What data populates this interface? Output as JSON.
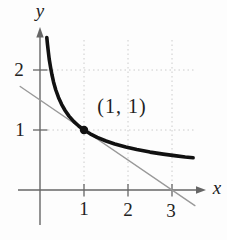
{
  "figure": {
    "background": "#fdfdfd"
  },
  "chart_data": {
    "type": "line",
    "title": "",
    "xlabel": "x",
    "ylabel": "y",
    "xlim": [
      -0.5,
      3.65
    ],
    "ylim": [
      -0.58,
      2.55
    ],
    "grid": {
      "style": "dotted",
      "vertical_x": [
        1,
        2,
        3
      ],
      "horizontal_y": [
        1,
        2
      ]
    },
    "x_ticks": [
      {
        "value": 1,
        "label": "1"
      },
      {
        "value": 2,
        "label": "2"
      },
      {
        "value": 3,
        "label": "3"
      }
    ],
    "y_ticks": [
      {
        "value": 1,
        "label": "1"
      },
      {
        "value": 2,
        "label": "2"
      }
    ],
    "series": [
      {
        "name": "tangent line y = (3 - x)/2",
        "color": "#999999",
        "width": 1.4,
        "points": [
          [
            -0.45,
            1.725
          ],
          [
            3.52,
            -0.26
          ]
        ]
      },
      {
        "name": "curve y = 1/sqrt(x)",
        "color": "#111111",
        "width": 3.6,
        "points": [
          [
            0.155,
            2.541
          ],
          [
            0.17,
            2.425
          ],
          [
            0.19,
            2.294
          ],
          [
            0.21,
            2.182
          ],
          [
            0.24,
            2.041
          ],
          [
            0.27,
            1.925
          ],
          [
            0.31,
            1.796
          ],
          [
            0.36,
            1.667
          ],
          [
            0.42,
            1.543
          ],
          [
            0.49,
            1.429
          ],
          [
            0.57,
            1.325
          ],
          [
            0.66,
            1.231
          ],
          [
            0.77,
            1.14
          ],
          [
            0.88,
            1.066
          ],
          [
            1.0,
            1.0
          ],
          [
            1.14,
            0.937
          ],
          [
            1.3,
            0.877
          ],
          [
            1.5,
            0.816
          ],
          [
            1.7,
            0.767
          ],
          [
            1.95,
            0.716
          ],
          [
            2.2,
            0.674
          ],
          [
            2.5,
            0.632
          ],
          [
            2.8,
            0.598
          ],
          [
            3.1,
            0.568
          ],
          [
            3.3,
            0.55
          ],
          [
            3.48,
            0.536
          ]
        ]
      }
    ],
    "marked_point": {
      "x": 1,
      "y": 1,
      "label": "(1, 1)"
    },
    "colors": {
      "curve": "#111111",
      "tangent": "#999999",
      "axis": "#666666",
      "grid": "#cccccc",
      "text": "#222222"
    }
  }
}
